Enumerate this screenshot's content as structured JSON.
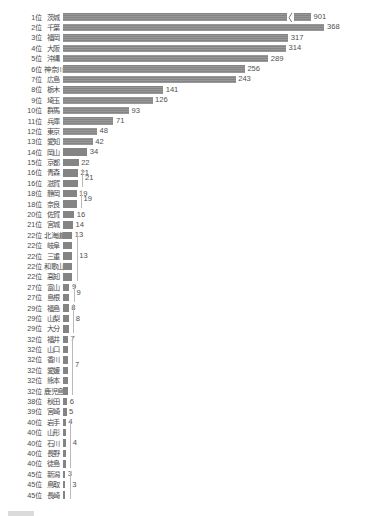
{
  "chart_data": {
    "type": "bar",
    "title": "",
    "subtitle": "",
    "xlabel": "",
    "ylabel": "",
    "orientation": "horizontal",
    "grid": false,
    "legend_position": "bottom",
    "axis_break": {
      "present": true,
      "applies_to_category": "茨城",
      "note": "〜"
    },
    "xlim": [
      0,
      380
    ],
    "rank_suffix": "位",
    "categories": [
      "茨城",
      "千葉",
      "福岡",
      "大阪",
      "沖縄",
      "神奈川",
      "広島",
      "栃木",
      "埼玉",
      "群馬",
      "兵庫",
      "東京",
      "愛知",
      "岡山",
      "京都",
      "青森",
      "滋賀",
      "静岡",
      "奈良",
      "佐賀",
      "宮城",
      "北海道",
      "岐阜",
      "三重",
      "和歌山",
      "高知",
      "富山",
      "島根",
      "福島",
      "山梨",
      "大分",
      "福井",
      "山口",
      "香川",
      "愛媛",
      "熊本",
      "鹿児島",
      "秋田",
      "宮崎",
      "岩手",
      "山形",
      "石川",
      "長野",
      "徒島",
      "新潟",
      "鳥取",
      "長崎"
    ],
    "ranks": [
      1,
      2,
      3,
      4,
      5,
      6,
      7,
      8,
      9,
      10,
      11,
      12,
      13,
      14,
      15,
      16,
      16,
      18,
      18,
      20,
      21,
      22,
      22,
      22,
      22,
      22,
      27,
      27,
      29,
      29,
      29,
      32,
      32,
      32,
      32,
      32,
      32,
      38,
      39,
      40,
      40,
      40,
      40,
      40,
      45,
      45,
      45
    ],
    "values": [
      901,
      368,
      317,
      314,
      289,
      256,
      243,
      141,
      126,
      93,
      71,
      48,
      42,
      34,
      22,
      21,
      21,
      19,
      19,
      16,
      14,
      13,
      13,
      13,
      13,
      13,
      9,
      9,
      8,
      8,
      8,
      7,
      7,
      7,
      7,
      7,
      7,
      6,
      5,
      4,
      4,
      4,
      4,
      4,
      3,
      3,
      3
    ],
    "value_label_display": [
      "901",
      "368",
      "317",
      "314",
      "289",
      "256",
      "243",
      "141",
      "126",
      "93",
      "71",
      "48",
      "42",
      "34",
      "22",
      "21",
      "",
      "19",
      "",
      "16",
      "14",
      "13",
      "",
      "",
      "",
      "",
      "9",
      "",
      "8",
      "",
      "",
      "7",
      "",
      "",
      "",
      "",
      "",
      "6",
      "5",
      "4",
      "",
      "",
      "",
      "",
      "3",
      "",
      ""
    ],
    "grouped_labels": [
      {
        "value": "21",
        "ranks": [
          16,
          16
        ],
        "start_index": 15,
        "span": 2
      },
      {
        "value": "19",
        "ranks": [
          18,
          18
        ],
        "start_index": 17,
        "span": 2
      },
      {
        "value": "13",
        "ranks": [
          22,
          22,
          22,
          22,
          22
        ],
        "start_index": 21,
        "span": 5
      },
      {
        "value": "9",
        "ranks": [
          27,
          27
        ],
        "start_index": 26,
        "span": 2
      },
      {
        "value": "8",
        "ranks": [
          29,
          29,
          29
        ],
        "start_index": 28,
        "span": 3
      },
      {
        "value": "7",
        "ranks": [
          32,
          32,
          32,
          32,
          32,
          32
        ],
        "start_index": 31,
        "span": 6
      },
      {
        "value": "4",
        "ranks": [
          40,
          40,
          40,
          40,
          40
        ],
        "start_index": 39,
        "span": 5
      },
      {
        "value": "3",
        "ranks": [
          45,
          45,
          45
        ],
        "start_index": 44,
        "span": 3
      }
    ],
    "colors": {
      "bar": "#848484",
      "background": "#ffffff",
      "text": "#4a4a4a",
      "bracket": "#b9b9b9"
    }
  },
  "footer": {
    "legend_label": ""
  }
}
